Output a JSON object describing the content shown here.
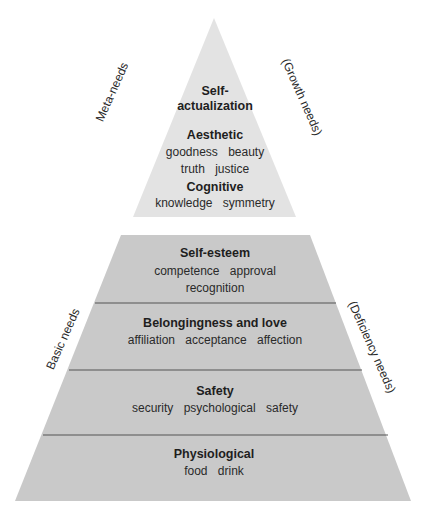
{
  "colors": {
    "growth_fill": "#e3e3e3",
    "deficiency_fill": "#c9c9c9",
    "divider": "#555555",
    "text": "#1e1e1e"
  },
  "growth_pyramid": {
    "left_label": "Meta-needs",
    "right_label": "(Growth needs)",
    "levels": [
      {
        "title": "Self-\nactualization",
        "title_line1": "Self-",
        "title_line2": "actualization",
        "items": []
      },
      {
        "title": "Aesthetic",
        "items": [
          "goodness",
          "beauty",
          "truth",
          "justice"
        ],
        "items_line1": "goodness beauty",
        "items_line2": "truth justice"
      },
      {
        "title": "Cognitive",
        "items": [
          "knowledge",
          "symmetry"
        ],
        "items_line1": "knowledge symmetry"
      }
    ]
  },
  "deficiency_pyramid": {
    "left_label": "Basic needs",
    "right_label": "(Deficiency needs)",
    "levels": [
      {
        "title": "Self-esteem",
        "items": [
          "competence",
          "approval",
          "recognition"
        ],
        "items_line1": "competence approval",
        "items_line2": "recognition"
      },
      {
        "title": "Belongingness and love",
        "items": [
          "affiliation",
          "acceptance",
          "affection"
        ],
        "items_line1": "affiliation acceptance affection"
      },
      {
        "title": "Safety",
        "items": [
          "security",
          "psychological safety"
        ],
        "items_line1": "security psychological safety"
      },
      {
        "title": "Physiological",
        "items": [
          "food",
          "drink"
        ],
        "items_line1": "food drink"
      }
    ]
  }
}
